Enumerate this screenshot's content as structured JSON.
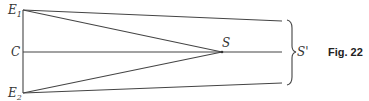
{
  "figure": {
    "caption": "Fig. 22",
    "labels": {
      "E1": {
        "main": "E",
        "sub": "1"
      },
      "E2": {
        "main": "E",
        "sub": "2"
      },
      "C": "C",
      "S": "S",
      "S_prime": "S'"
    }
  }
}
